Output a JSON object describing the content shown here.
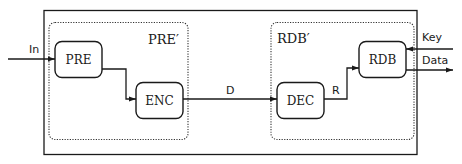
{
  "diagram": {
    "outer_box": {
      "label": ""
    },
    "groups": [
      {
        "id": "pre_prime",
        "label": "PRE′"
      },
      {
        "id": "rdb_prime",
        "label": "RDB′"
      }
    ],
    "blocks": [
      {
        "id": "pre",
        "label": "PRE"
      },
      {
        "id": "enc",
        "label": "ENC"
      },
      {
        "id": "dec",
        "label": "DEC"
      },
      {
        "id": "rdb",
        "label": "RDB"
      }
    ],
    "signals": {
      "input": "In",
      "enc_to_dec": "D",
      "dec_to_rdb": "R",
      "key": "Key",
      "data": "Data"
    },
    "colors": {
      "stroke": "#1a1a1a",
      "background": "#ffffff"
    }
  }
}
